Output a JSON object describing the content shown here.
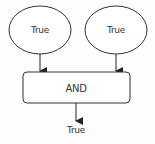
{
  "diagram": {
    "type": "logic-gate-flow",
    "inputs": [
      {
        "label": "True"
      },
      {
        "label": "True"
      }
    ],
    "gate": {
      "label": "AND"
    },
    "output": {
      "label": "True"
    },
    "colors": {
      "stroke": "#333333",
      "fill": "#ffffff",
      "background": "#fdfdfd"
    }
  }
}
